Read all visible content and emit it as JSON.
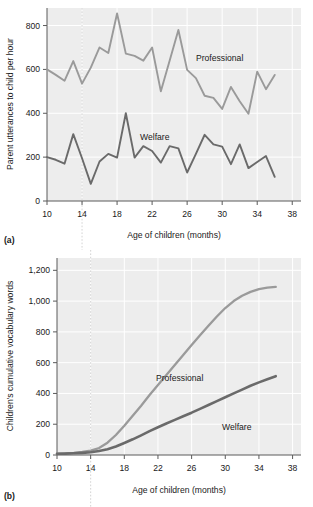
{
  "figure": {
    "panels": [
      {
        "id": "a",
        "panel_label": "(a)",
        "xlabel": "Age of children (months)",
        "ylabel": "Parent utterances to child per hour",
        "series_labels": {
          "professional": "Professional",
          "welfare": "Welfare"
        },
        "xticks": [
          "10",
          "14",
          "18",
          "22",
          "26",
          "30",
          "34",
          "38"
        ],
        "yticks": [
          "0",
          "200",
          "400",
          "600",
          "800"
        ]
      },
      {
        "id": "b",
        "panel_label": "(b)",
        "xlabel": "Age of children (months)",
        "ylabel": "Children's cumulative vocabulary words",
        "series_labels": {
          "professional": "Professional",
          "welfare": "Welfare"
        },
        "xticks": [
          "10",
          "14",
          "18",
          "22",
          "26",
          "30",
          "34",
          "38"
        ],
        "yticks": [
          "0",
          "200",
          "400",
          "600",
          "800",
          "1,000",
          "1,200"
        ]
      }
    ],
    "colors": {
      "professional_line": "#9a9a9a",
      "welfare_line": "#6a6a6a",
      "plot_background": "#ededed",
      "gridline": "#ffffff",
      "axis": "#5a5a5a",
      "text": "#1a1a1a",
      "guide_line": "#cfcfcf"
    },
    "guide_line_month": 14
  },
  "chart_data": [
    {
      "type": "line",
      "panel": "a",
      "title": "",
      "xlabel": "Age of children (months)",
      "ylabel": "Parent utterances to child per hour",
      "xlim": [
        10,
        39
      ],
      "ylim": [
        0,
        880
      ],
      "xticks": [
        10,
        14,
        18,
        22,
        26,
        30,
        34,
        38
      ],
      "yticks": [
        0,
        200,
        400,
        600,
        800
      ],
      "grid": true,
      "legend": "inline-annotation",
      "x": [
        10,
        11,
        12,
        13,
        14,
        15,
        16,
        17,
        18,
        19,
        20,
        21,
        22,
        23,
        24,
        25,
        26,
        27,
        28,
        29,
        30,
        31,
        32,
        33,
        34,
        35,
        36
      ],
      "series": [
        {
          "name": "Professional",
          "color": "#9a9a9a",
          "values": [
            600,
            575,
            548,
            638,
            535,
            608,
            700,
            675,
            855,
            672,
            662,
            640,
            700,
            500,
            640,
            780,
            598,
            560,
            480,
            470,
            420,
            520,
            455,
            398,
            590,
            510,
            575
          ]
        },
        {
          "name": "Welfare",
          "color": "#6a6a6a",
          "values": [
            200,
            188,
            170,
            305,
            195,
            78,
            180,
            215,
            198,
            400,
            198,
            250,
            228,
            175,
            250,
            240,
            130,
            215,
            302,
            258,
            248,
            168,
            258,
            150,
            178,
            205,
            110
          ]
        }
      ]
    },
    {
      "type": "line",
      "panel": "b",
      "title": "",
      "xlabel": "Age of children (months)",
      "ylabel": "Children's cumulative vocabulary words",
      "xlim": [
        10,
        39
      ],
      "ylim": [
        0,
        1280
      ],
      "xticks": [
        10,
        14,
        18,
        22,
        26,
        30,
        34,
        38
      ],
      "yticks": [
        0,
        200,
        400,
        600,
        800,
        1000,
        1200
      ],
      "grid": true,
      "legend": "inline-annotation",
      "x": [
        10,
        11,
        12,
        13,
        14,
        15,
        16,
        17,
        18,
        19,
        20,
        21,
        22,
        23,
        24,
        25,
        26,
        27,
        28,
        29,
        30,
        31,
        32,
        33,
        34,
        35,
        36
      ],
      "series": [
        {
          "name": "Professional",
          "color": "#9a9a9a",
          "values": [
            8,
            10,
            14,
            20,
            28,
            45,
            80,
            130,
            190,
            255,
            320,
            390,
            455,
            520,
            585,
            650,
            715,
            778,
            840,
            900,
            955,
            1000,
            1035,
            1060,
            1078,
            1088,
            1092
          ]
        },
        {
          "name": "Welfare",
          "color": "#6a6a6a",
          "values": [
            8,
            9,
            11,
            14,
            18,
            26,
            38,
            55,
            78,
            102,
            128,
            155,
            180,
            205,
            228,
            252,
            275,
            300,
            325,
            350,
            375,
            400,
            425,
            450,
            472,
            492,
            512
          ]
        }
      ]
    }
  ]
}
